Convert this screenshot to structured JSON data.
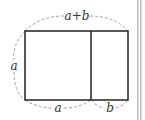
{
  "diagram": {
    "type": "geometric-rectangle-partition",
    "labels": {
      "top": "a+b",
      "left": "a",
      "bottom_left": "a",
      "bottom_right": "b"
    },
    "colors": {
      "stroke": "#222222",
      "dashed": "#888888",
      "bar": "#bbbbbb",
      "background": "#ffffff"
    },
    "shapes": {
      "outer_rectangle": {
        "x": 25,
        "y": 31,
        "width": 103,
        "height": 69
      },
      "divider_x": 91
    }
  }
}
